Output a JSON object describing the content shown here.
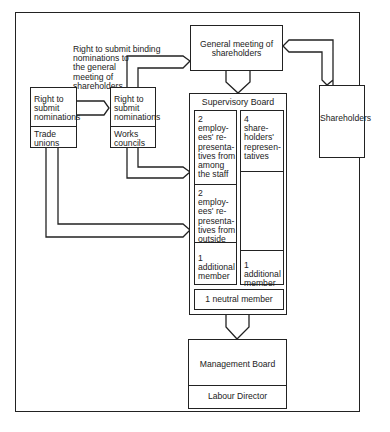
{
  "diagram": {
    "annotation": "Right to submit binding nominations to the general meeting of shareholders",
    "trade_unions": {
      "right": "Right to submit nominations",
      "label": "Trade unions"
    },
    "works_councils": {
      "right": "Right to submit nominations",
      "label": "Works councils"
    },
    "general_meeting": "General meeting of shareholders",
    "shareholders": "Shareholders",
    "supervisory_board": {
      "title": "Supervisory Board",
      "left_column": [
        "2 employees' representatives from among the staff",
        "2 employees' representatives from outside",
        "1 additional member"
      ],
      "right_column": [
        "4 shareholders' representatives",
        "1 additional member"
      ],
      "neutral": "1 neutral member"
    },
    "management_board": {
      "title": "Management Board",
      "sub": "Labour Director"
    }
  },
  "lines": {
    "annotation": [
      "Right to submit binding",
      "nominations to",
      "the general",
      "meeting of",
      "shareholders"
    ],
    "tu_right": [
      "Right to",
      "submit",
      "nominations"
    ],
    "tu_label": [
      "Trade",
      "unions"
    ],
    "wc_right": [
      "Right to",
      "submit",
      "nominations"
    ],
    "wc_label": [
      "Works",
      "councils"
    ],
    "gm": [
      "General meeting of",
      "shareholders"
    ],
    "sb_left_1": [
      "2",
      "employ-",
      "ees' re-",
      "presenta-",
      "tives from",
      "among",
      "the staff"
    ],
    "sb_left_2": [
      "2",
      "employ-",
      "ees' re-",
      "presenta-",
      "tives from",
      "outside"
    ],
    "sb_left_3": [
      "1",
      "additional",
      "member"
    ],
    "sb_right_1": [
      "4",
      "share-",
      "holders'",
      "represen-",
      "tatives"
    ],
    "sb_right_2": [
      "1",
      "additional",
      "member"
    ]
  }
}
